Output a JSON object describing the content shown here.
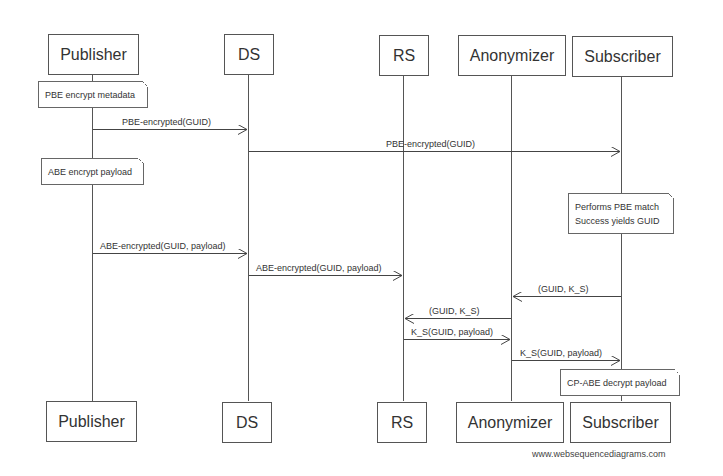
{
  "diagram": {
    "type": "sequence",
    "actors": [
      {
        "id": "publisher",
        "label": "Publisher"
      },
      {
        "id": "ds",
        "label": "DS"
      },
      {
        "id": "rs",
        "label": "RS"
      },
      {
        "id": "anonymizer",
        "label": "Anonymizer"
      },
      {
        "id": "subscriber",
        "label": "Subscriber"
      }
    ],
    "notes": [
      {
        "over": "publisher",
        "lines": [
          "PBE encrypt metadata"
        ]
      },
      {
        "over": "publisher",
        "lines": [
          "ABE encrypt payload"
        ]
      },
      {
        "over": "subscriber",
        "lines": [
          "Performs PBE match",
          "Success yields GUID"
        ]
      },
      {
        "over": "subscriber",
        "lines": [
          "CP-ABE decrypt payload"
        ]
      }
    ],
    "messages": [
      {
        "from": "publisher",
        "to": "ds",
        "label": "PBE-encrypted(GUID)"
      },
      {
        "from": "ds",
        "to": "subscriber",
        "label": "PBE-encrypted(GUID)"
      },
      {
        "from": "publisher",
        "to": "ds",
        "label": "ABE-encrypted(GUID, payload)"
      },
      {
        "from": "ds",
        "to": "rs",
        "label": "ABE-encrypted(GUID, payload)"
      },
      {
        "from": "subscriber",
        "to": "anonymizer",
        "label": "(GUID, K_S)"
      },
      {
        "from": "anonymizer",
        "to": "rs",
        "label": "(GUID, K_S)"
      },
      {
        "from": "rs",
        "to": "anonymizer",
        "label": "K_S(GUID, payload)"
      },
      {
        "from": "anonymizer",
        "to": "subscriber",
        "label": "K_S(GUID, payload)"
      }
    ],
    "watermark": "www.websequencediagrams.com"
  }
}
